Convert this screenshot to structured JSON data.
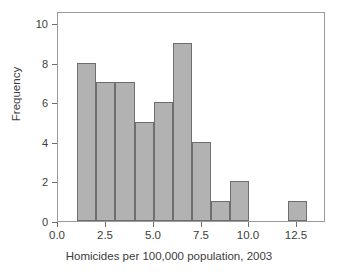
{
  "chart_data": {
    "type": "bar",
    "title": "",
    "subtitle": "",
    "xlabel": "Homicides per 100,000 population, 2003",
    "ylabel": "Frequency",
    "xlim": [
      0.0,
      14.0
    ],
    "ylim": [
      0,
      10.6
    ],
    "xticks": [
      "0.0",
      "2.5",
      "5.0",
      "7.5",
      "10.0",
      "12.5"
    ],
    "xtick_values": [
      0.0,
      2.5,
      5.0,
      7.5,
      10.0,
      12.5
    ],
    "yticks": [
      "0",
      "2",
      "4",
      "6",
      "8",
      "10"
    ],
    "ytick_values": [
      0,
      2,
      4,
      6,
      8,
      10
    ],
    "grid": false,
    "legend": false,
    "legend_position": "none",
    "bin_width": 1.0,
    "bin_edges": [
      1,
      2,
      3,
      4,
      5,
      6,
      7,
      8,
      9,
      10,
      12,
      13
    ],
    "categories": [
      "1-2",
      "2-3",
      "3-4",
      "4-5",
      "5-6",
      "6-7",
      "7-8",
      "8-9",
      "9-10",
      "12-13"
    ],
    "values": [
      8,
      7,
      7,
      5,
      6,
      9,
      4,
      1,
      2,
      1
    ],
    "bars": [
      {
        "x0": 1,
        "x1": 2,
        "value": 8
      },
      {
        "x0": 2,
        "x1": 3,
        "value": 7
      },
      {
        "x0": 3,
        "x1": 4,
        "value": 7
      },
      {
        "x0": 4,
        "x1": 5,
        "value": 5
      },
      {
        "x0": 5,
        "x1": 6,
        "value": 6
      },
      {
        "x0": 6,
        "x1": 7,
        "value": 9
      },
      {
        "x0": 7,
        "x1": 8,
        "value": 4
      },
      {
        "x0": 8,
        "x1": 9,
        "value": 1
      },
      {
        "x0": 9,
        "x1": 10,
        "value": 2
      },
      {
        "x0": 12,
        "x1": 13,
        "value": 1
      }
    ],
    "colors": {
      "bar_fill": "#b2b2b2",
      "bar_edge": "#6e6e6e",
      "axis": "#6e6e6e",
      "text": "#3c3c3c",
      "background": "#ffffff"
    }
  }
}
